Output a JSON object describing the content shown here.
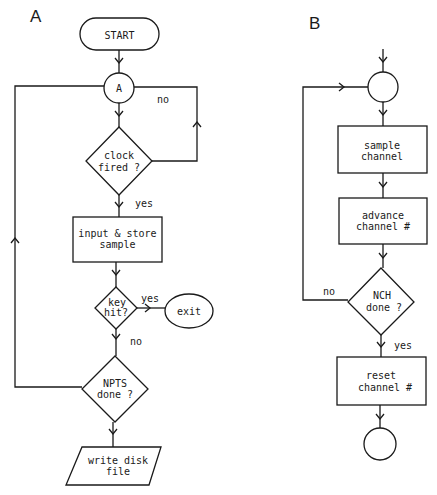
{
  "panelA": {
    "label": "A",
    "start": "START",
    "connector": "A",
    "clock": [
      "clock",
      "fired ?"
    ],
    "clock_no": "no",
    "clock_yes": "yes",
    "input": [
      "input & store",
      "sample"
    ],
    "key": [
      "key",
      "hit?"
    ],
    "key_yes": "yes",
    "key_no": "no",
    "exit": "exit",
    "npts": [
      "NPTS",
      "done ?"
    ],
    "write": [
      "write disk",
      "file"
    ]
  },
  "panelB": {
    "label": "B",
    "sample": [
      "sample",
      "channel"
    ],
    "advance": [
      "advance",
      "channel #"
    ],
    "nch": [
      "NCH",
      "done ?"
    ],
    "nch_no": "no",
    "nch_yes": "yes",
    "reset": [
      "reset",
      "channel #"
    ]
  }
}
